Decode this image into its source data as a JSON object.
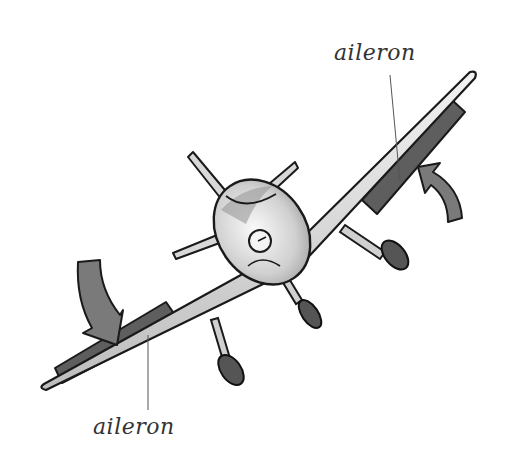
{
  "diagram": {
    "labels": {
      "top_aileron": "aileron",
      "bottom_aileron": "aileron"
    },
    "arrows": {
      "right_wing_arrow": "up",
      "left_wing_arrow": "down"
    },
    "colors": {
      "background": "#ffffff",
      "aileron_fill": "#5e5e5e",
      "arrow_fill": "#7a7a7a",
      "outline": "#1a1a1a",
      "wing_fill": "#d4d4d4",
      "leader_line": "#555555",
      "label_text": "#333333"
    }
  }
}
